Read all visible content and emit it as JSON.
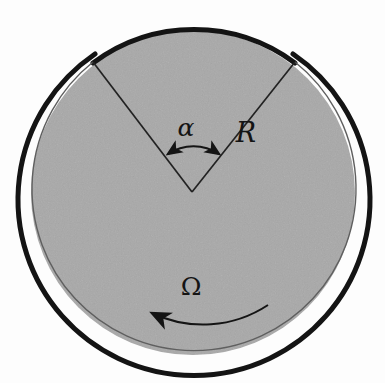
{
  "figure": {
    "background_color": "#fdfdfd",
    "disc_fill_color": "#a8a8a8",
    "stroke_color": "#141414",
    "width": 385,
    "height": 383
  },
  "geometry": {
    "center_x": 193,
    "center_y": 193,
    "disc_radius": 162,
    "ring_radius": 169,
    "ring_thickness": 5,
    "wedge_vertex_x": 192,
    "wedge_vertex_y": 192,
    "wedge_left_end_x": 93,
    "wedge_left_end_y": 62,
    "wedge_right_end_x": 295,
    "wedge_right_end_y": 62,
    "alpha_angle_degrees": 76
  },
  "labels": {
    "angle": {
      "text": "α",
      "name": "alpha",
      "x": 186,
      "y": 136
    },
    "radius": {
      "text": "R",
      "name": "R",
      "x": 246,
      "y": 142
    },
    "angular_velocity": {
      "text": "Ω",
      "name": "Omega",
      "x": 191,
      "y": 295
    }
  },
  "annotations": {
    "angle_arrow": {
      "name": "double-headed-arc-arrow",
      "direction": "bidirectional",
      "description": "arc spanning the wedge angle alpha"
    },
    "rotation_arrow": {
      "name": "rotation-arc-arrow",
      "direction": "counterclockwise-leftward",
      "description": "curved arrow indicating rotation sense Omega"
    }
  }
}
